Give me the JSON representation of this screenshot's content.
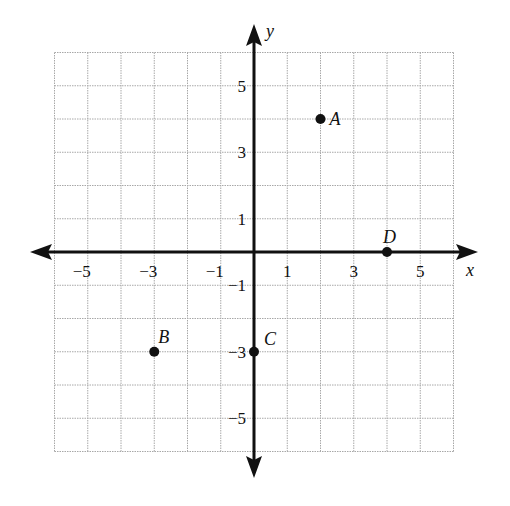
{
  "chart_data": {
    "type": "scatter",
    "title": "",
    "xlabel": "x",
    "ylabel": "y",
    "xlim": [
      -6,
      6
    ],
    "ylim": [
      -6,
      6
    ],
    "grid": true,
    "grid_step": 1,
    "x_tick_labels": [
      {
        "value": -5,
        "label": "−5"
      },
      {
        "value": -3,
        "label": "−3"
      },
      {
        "value": -1,
        "label": "−1"
      },
      {
        "value": 1,
        "label": "1"
      },
      {
        "value": 3,
        "label": "3"
      },
      {
        "value": 5,
        "label": "5"
      }
    ],
    "y_tick_labels": [
      {
        "value": 5,
        "label": "5"
      },
      {
        "value": 3,
        "label": "3"
      },
      {
        "value": 1,
        "label": "1"
      },
      {
        "value": -1,
        "label": "−1"
      },
      {
        "value": -3,
        "label": "−3"
      },
      {
        "value": -5,
        "label": "−5"
      }
    ],
    "points": [
      {
        "label": "A",
        "x": 2,
        "y": 4
      },
      {
        "label": "B",
        "x": -3,
        "y": -3
      },
      {
        "label": "C",
        "x": 0,
        "y": -3
      },
      {
        "label": "D",
        "x": 4,
        "y": 0
      }
    ]
  },
  "colors": {
    "axis": "#111111",
    "grid": "#a8a8a8",
    "point": "#111111",
    "background": "#ffffff"
  }
}
